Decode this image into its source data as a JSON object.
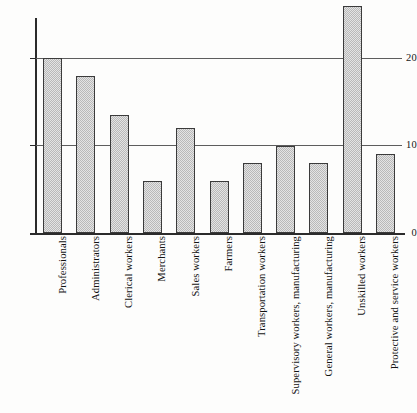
{
  "chart_data": {
    "type": "bar",
    "title": "",
    "subtitle": "",
    "xlabel": "",
    "ylabel": "",
    "ylim": [
      0,
      26.5
    ],
    "yticks": [
      0,
      10,
      20
    ],
    "ytick_labels": [
      "0",
      "10",
      "20"
    ],
    "grid": "horizontal-gridlines-at-10-and-20",
    "legend": "none",
    "orientation": "vertical",
    "bar_style": "gray-dithered-fill-with-dark-outline",
    "categories": [
      "Professionals",
      "Administrators",
      "Clerical workers",
      "Merchants",
      "Sales workers",
      "Farmers",
      "Transportation workers",
      "Supervisory workers, manufacturing",
      "General workers, manufacturing",
      "Unskilled workers",
      "Protective and service workers"
    ],
    "values": [
      20,
      18,
      13.5,
      6,
      12,
      6,
      8,
      10,
      8,
      26,
      9
    ],
    "colors": {
      "bar_fill": "#b9b9b9",
      "bar_edge": "#3b3b3b",
      "axis": "#2b2b2b",
      "gridline": "#5d5d5d",
      "background": "#fdfdfc",
      "text": "#131313"
    }
  },
  "axes": {
    "y_tick_0": "0",
    "y_tick_10": "10",
    "y_tick_20": "20"
  }
}
